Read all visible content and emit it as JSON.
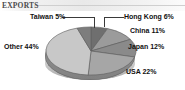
{
  "header": {
    "title": "EXPORTS"
  },
  "chart_data": {
    "type": "pie",
    "title": "EXPORTS",
    "subtitle": "",
    "xlabel": "",
    "ylabel": "",
    "legend_position": "none",
    "grid": false,
    "unit": "%",
    "categories": [
      "Hong Kong",
      "China",
      "Japan",
      "USA",
      "Other",
      "Taiwan"
    ],
    "values": [
      6,
      11,
      12,
      22,
      44,
      5
    ],
    "labels": [
      "Hong Kong 6%",
      "China 11%",
      "Japan 12%",
      "USA 22%",
      "Other 44%",
      "Taiwan 5%"
    ],
    "slices": [
      {
        "name": "Hong Kong",
        "value": 6,
        "label": "Hong Kong 6%",
        "color": "#6f6f6f"
      },
      {
        "name": "China",
        "value": 11,
        "label": "China 11%",
        "color": "#9b9b9b"
      },
      {
        "name": "Japan",
        "value": 12,
        "label": "Japan 12%",
        "color": "#8a8a8a"
      },
      {
        "name": "USA",
        "value": 22,
        "label": "USA 22%",
        "color": "#a6a6a6"
      },
      {
        "name": "Other",
        "value": 44,
        "label": "Other 44%",
        "color": "#c8c8c8"
      },
      {
        "name": "Taiwan",
        "value": 5,
        "label": "Taiwan 5%",
        "color": "#7d7d7d"
      }
    ],
    "total": 100
  },
  "colors": {
    "text": "#111111",
    "header_text": "#4a4a4a",
    "header_band": "#ececec",
    "pie_outline": "#5e5e5e",
    "background": "#ffffff"
  }
}
